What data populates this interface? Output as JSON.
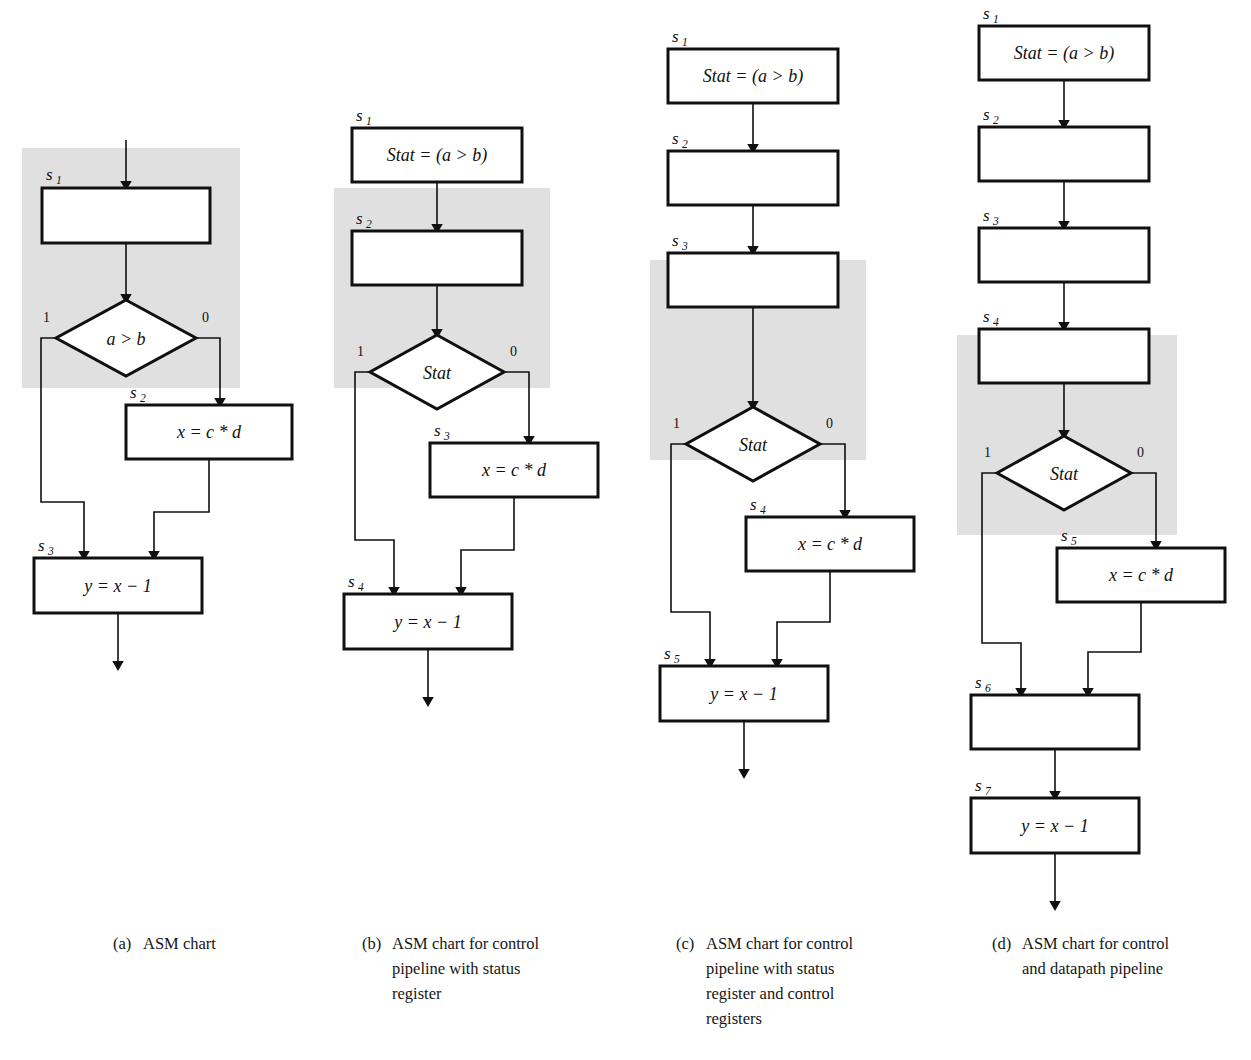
{
  "figure": {
    "kind": "asm-chart-figure",
    "panel_count": 4,
    "shade_color": "#e0e0e0",
    "stroke_color": "#101010",
    "background": "#ffffff"
  },
  "symbols": {
    "state_s1": "s",
    "sub1": "1",
    "sub2": "2",
    "sub3": "3",
    "sub4": "4",
    "sub5": "5",
    "sub6": "6",
    "sub7": "7",
    "branch_true": "1",
    "branch_false": "0",
    "expr_stat_assign": "Stat = (a > b)",
    "expr_mult": "x = c * d",
    "expr_dec": "y = x − 1",
    "cond_ab": "a > b",
    "cond_stat": "Stat"
  },
  "panels": [
    {
      "id": "a",
      "caption_tag": "(a)",
      "caption_text": "ASM chart",
      "shaded_states": [
        "s1"
      ],
      "nodes": [
        {
          "name": "s1",
          "type": "state-box",
          "label": "",
          "state": "s",
          "sub": "1",
          "shaded": true
        },
        {
          "name": "d1",
          "type": "decision",
          "label": "a > b",
          "true_label": "1",
          "false_label": "0",
          "shaded": true
        },
        {
          "name": "s2",
          "type": "state-box",
          "label": "x = c * d",
          "state": "s",
          "sub": "2",
          "shaded": false
        },
        {
          "name": "s3",
          "type": "state-box",
          "label": "y = x − 1",
          "state": "s",
          "sub": "3",
          "shaded": false
        }
      ]
    },
    {
      "id": "b",
      "caption_tag": "(b)",
      "caption_text": "ASM chart for control\npipeline  with status\nregister",
      "shaded_states": [
        "s2"
      ],
      "nodes": [
        {
          "name": "s1",
          "type": "state-box",
          "label": "Stat = (a > b)",
          "state": "s",
          "sub": "1",
          "shaded": false
        },
        {
          "name": "s2",
          "type": "state-box",
          "label": "",
          "state": "s",
          "sub": "2",
          "shaded": true
        },
        {
          "name": "d1",
          "type": "decision",
          "label": "Stat",
          "true_label": "1",
          "false_label": "0",
          "shaded": true
        },
        {
          "name": "s3",
          "type": "state-box",
          "label": "x = c * d",
          "state": "s",
          "sub": "3",
          "shaded": false
        },
        {
          "name": "s4",
          "type": "state-box",
          "label": "y = x − 1",
          "state": "s",
          "sub": "4",
          "shaded": false
        }
      ]
    },
    {
      "id": "c",
      "caption_tag": "(c)",
      "caption_text": "ASM chart for control\npipeline with status\nregister and control\nregisters",
      "shaded_states": [
        "s3"
      ],
      "nodes": [
        {
          "name": "s1",
          "type": "state-box",
          "label": "Stat = (a > b)",
          "state": "s",
          "sub": "1",
          "shaded": false
        },
        {
          "name": "s2",
          "type": "state-box",
          "label": "",
          "state": "s",
          "sub": "2",
          "shaded": false
        },
        {
          "name": "s3",
          "type": "state-box",
          "label": "",
          "state": "s",
          "sub": "3",
          "shaded": true
        },
        {
          "name": "d1",
          "type": "decision",
          "label": "Stat",
          "true_label": "1",
          "false_label": "0",
          "shaded": true
        },
        {
          "name": "s4",
          "type": "state-box",
          "label": "x = c * d",
          "state": "s",
          "sub": "4",
          "shaded": false
        },
        {
          "name": "s5",
          "type": "state-box",
          "label": "y = x − 1",
          "state": "s",
          "sub": "5",
          "shaded": false
        }
      ]
    },
    {
      "id": "d",
      "caption_tag": "(d)",
      "caption_text": "ASM chart for control\nand datapath pipeline",
      "shaded_states": [
        "s4"
      ],
      "nodes": [
        {
          "name": "s1",
          "type": "state-box",
          "label": "Stat = (a > b)",
          "state": "s",
          "sub": "1",
          "shaded": false
        },
        {
          "name": "s2",
          "type": "state-box",
          "label": "",
          "state": "s",
          "sub": "2",
          "shaded": false
        },
        {
          "name": "s3",
          "type": "state-box",
          "label": "",
          "state": "s",
          "sub": "3",
          "shaded": false
        },
        {
          "name": "s4",
          "type": "state-box",
          "label": "",
          "state": "s",
          "sub": "4",
          "shaded": true
        },
        {
          "name": "d1",
          "type": "decision",
          "label": "Stat",
          "true_label": "1",
          "false_label": "0",
          "shaded": true
        },
        {
          "name": "s5",
          "type": "state-box",
          "label": "x = c * d",
          "state": "s",
          "sub": "5",
          "shaded": false
        },
        {
          "name": "s6",
          "type": "state-box",
          "label": "",
          "state": "s",
          "sub": "6",
          "shaded": false
        },
        {
          "name": "s7",
          "type": "state-box",
          "label": "y = x − 1",
          "state": "s",
          "sub": "7",
          "shaded": false
        }
      ]
    }
  ]
}
